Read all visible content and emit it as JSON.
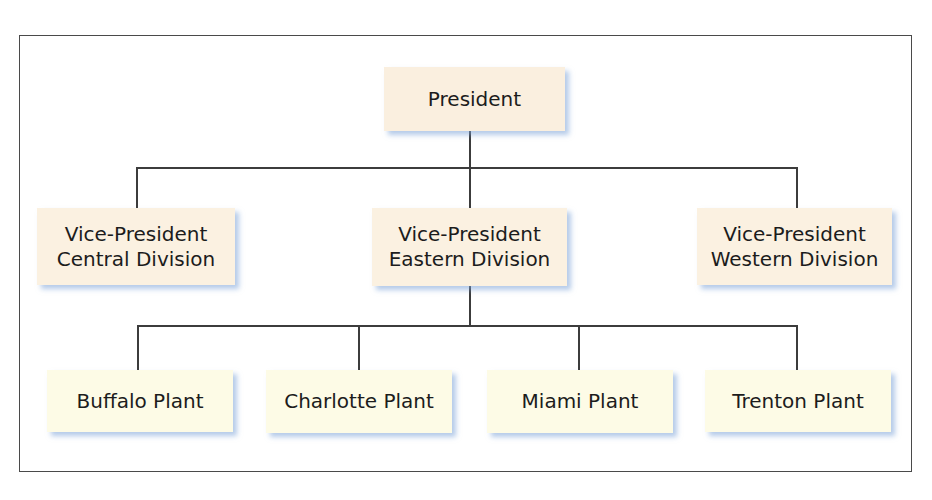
{
  "chart": {
    "title": "",
    "colors": {
      "executive_fill": "#fbf1e1",
      "plant_fill": "#fdfbe6",
      "connector": "#3c3c3c",
      "shadow": "#78a0d7",
      "frame": "#4a4a4a"
    },
    "president": {
      "label": "President"
    },
    "vice_presidents": [
      {
        "line1": "Vice-President",
        "line2": "Central Division"
      },
      {
        "line1": "Vice-President",
        "line2": "Eastern Division"
      },
      {
        "line1": "Vice-President",
        "line2": "Western Division"
      }
    ],
    "plants": [
      {
        "label": "Buffalo Plant"
      },
      {
        "label": "Charlotte Plant"
      },
      {
        "label": "Miami Plant"
      },
      {
        "label": "Trenton Plant"
      }
    ],
    "hierarchy": {
      "President": [
        "Vice-President Central Division",
        "Vice-President Eastern Division",
        "Vice-President Western Division"
      ],
      "Vice-President Eastern Division": [
        "Buffalo Plant",
        "Charlotte Plant",
        "Miami Plant",
        "Trenton Plant"
      ]
    }
  }
}
